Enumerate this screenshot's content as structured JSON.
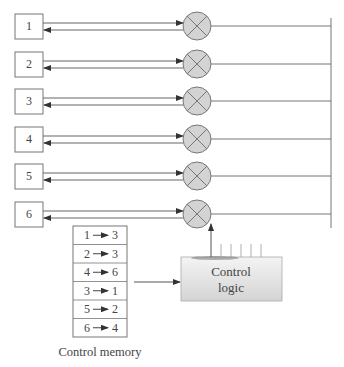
{
  "diagram": {
    "type": "time-multiplexed space switch with control memory",
    "ports": [
      {
        "label": "1",
        "y": 26
      },
      {
        "label": "2",
        "y": 64
      },
      {
        "label": "3",
        "y": 101
      },
      {
        "label": "4",
        "y": 139
      },
      {
        "label": "5",
        "y": 176
      },
      {
        "label": "6",
        "y": 214
      }
    ],
    "crosspoint_icon": "circled-x-icon",
    "control_memory": {
      "title": "Control memory",
      "entries": [
        {
          "from": "1",
          "to": "3"
        },
        {
          "from": "2",
          "to": "3"
        },
        {
          "from": "4",
          "to": "6"
        },
        {
          "from": "3",
          "to": "1"
        },
        {
          "from": "5",
          "to": "2"
        },
        {
          "from": "6",
          "to": "4"
        }
      ]
    },
    "control_logic": {
      "line1": "Control",
      "line2": "logic"
    },
    "colors": {
      "line": "#777777",
      "crosspoint_fill": "#d3d3d3",
      "logic_fill_top": "#f2f2f2",
      "logic_fill_bottom": "#d6d6d6"
    }
  }
}
